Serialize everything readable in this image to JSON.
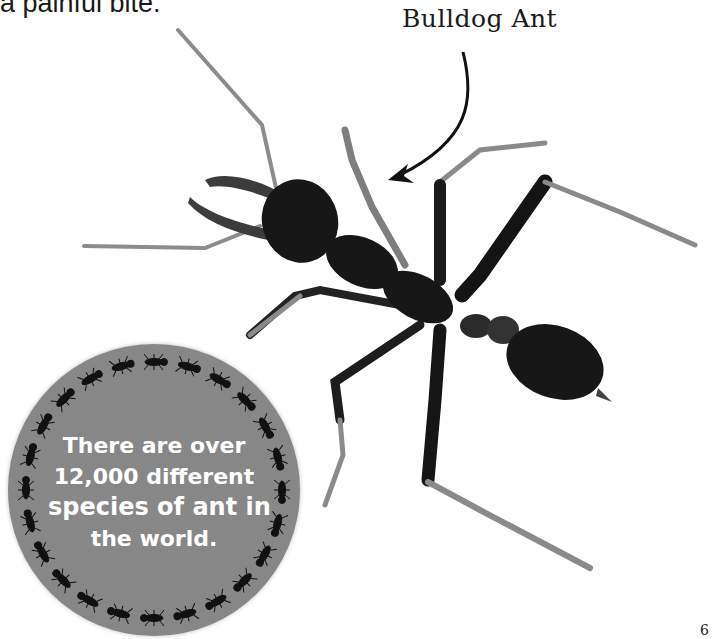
{
  "page": {
    "top_text_fragment": "a painful bite.",
    "page_number_fragment": "6"
  },
  "callout": {
    "label": "Bulldog Ant",
    "arrow_icon": "curved-arrow-icon"
  },
  "fact_circle": {
    "lines": [
      "There are over",
      "12,000 different",
      "species of ant in",
      "the world."
    ],
    "highlight_word": "species",
    "background_color": "#878787",
    "text_color": "#ffffff",
    "border_decoration": "ring-of-ants",
    "ant_count": 24
  },
  "photo": {
    "subject": "bulldog-ant",
    "description": "Photograph of a bulldog ant viewed from above with long toothed mandibles"
  },
  "colors": {
    "background": "#ffffff",
    "ant_body": "#161616",
    "ant_leg_light": "#8a8a8a"
  }
}
